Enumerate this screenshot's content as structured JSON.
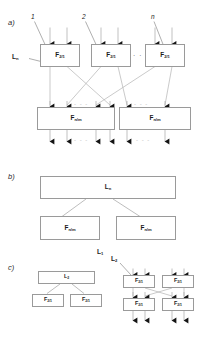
{
  "figure": {
    "type": "block-diagram",
    "panels": [
      "a)",
      "b)",
      "c)"
    ],
    "line_color": "#9a9a9a",
    "arrow_color": "#1a1a1a",
    "box_fill": "#ffffff",
    "text_color": "#1a1a1a"
  },
  "labels": {
    "panel_a": "a)",
    "panel_b": "b)",
    "panel_c": "c)",
    "index_1": "1",
    "index_2": "2",
    "index_n": "n",
    "ellipsis": "· · ·",
    "ellipsis_dashed": "- - -"
  },
  "blocks": {
    "f21": "F",
    "f21_sub": "2/1",
    "fnm": "F",
    "fnm_sub": "n/m",
    "ln": "L",
    "ln_sub": "n",
    "l2": "L",
    "l2_sub": "2",
    "l1": "L",
    "l1_sub": "1"
  },
  "panel_a": {
    "top_row": [
      {
        "name": "F",
        "sub": "2/1",
        "index": "1"
      },
      {
        "name": "F",
        "sub": "2/1",
        "index": "2"
      },
      {
        "name": "F",
        "sub": "2/1",
        "index": "n"
      }
    ],
    "bottom_row": [
      {
        "name": "F",
        "sub": "n/m"
      },
      {
        "name": "F",
        "sub": "n/m"
      }
    ],
    "callout": {
      "name": "L",
      "sub": "n"
    }
  },
  "panel_b": {
    "parent": {
      "name": "L",
      "sub": "n"
    },
    "children": [
      {
        "name": "F",
        "sub": "n/m"
      },
      {
        "name": "F",
        "sub": "n/m"
      }
    ],
    "footer": {
      "name": "L",
      "sub": "1"
    }
  },
  "panel_c": {
    "left": {
      "parent": {
        "name": "L",
        "sub": "2"
      },
      "children": [
        {
          "name": "F",
          "sub": "2/1"
        },
        {
          "name": "F",
          "sub": "2/1"
        }
      ]
    },
    "right": {
      "callout": {
        "name": "L",
        "sub": "2"
      },
      "grid": [
        [
          {
            "name": "F",
            "sub": "2/1"
          },
          {
            "name": "F",
            "sub": "2/1"
          }
        ],
        [
          {
            "name": "F",
            "sub": "2/1"
          },
          {
            "name": "F",
            "sub": "2/1"
          }
        ]
      ]
    }
  }
}
